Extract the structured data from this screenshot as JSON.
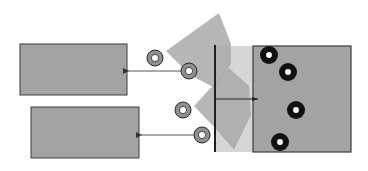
{
  "diagram": {
    "width": 368,
    "height": 171,
    "background": "#ffffff",
    "colors": {
      "box_fill": "#a3a3a3",
      "box_stroke": "#3c3c3c",
      "fan_fill": "#a9a9a9",
      "band_fill": "#d6d6d6",
      "bar": "#1e1e1e",
      "arrow": "#555555",
      "roller_ring": "#8f8f8f",
      "roller_stroke": "#2a2a2a",
      "dot_ring": "#111111",
      "dot_center": "#ffffff"
    },
    "left_boxes": [
      {
        "id": "upper-output-box",
        "x": 20,
        "y": 44,
        "w": 107,
        "h": 51
      },
      {
        "id": "lower-output-box",
        "x": 31,
        "y": 107,
        "w": 108,
        "h": 51
      }
    ],
    "target_box": {
      "id": "target-box",
      "x": 253,
      "y": 46,
      "w": 98,
      "h": 106
    },
    "light_band": {
      "x": 215,
      "y": 46,
      "w": 38,
      "h": 106
    },
    "vertical_bar": {
      "x": 215,
      "y1": 45,
      "y2": 152
    },
    "fans": [
      {
        "id": "upper-fan",
        "points": "166,51 219,13 231,44 231,64 215,88 190,75"
      },
      {
        "id": "lower-fan",
        "points": "194,106 229,68 249,86 251,115 234,150 215,128"
      }
    ],
    "connector": {
      "x1": 215,
      "y1": 99,
      "x2": 258,
      "y2": 99
    },
    "arrows": [
      {
        "id": "upper-arrow",
        "x1": 183,
        "y1": 71,
        "x2": 128,
        "y2": 71
      },
      {
        "id": "lower-arrow",
        "x1": 196,
        "y1": 135,
        "x2": 141,
        "y2": 135
      }
    ],
    "rollers": [
      {
        "id": "roller-1",
        "cx": 155,
        "cy": 58,
        "r": 8
      },
      {
        "id": "roller-2",
        "cx": 189,
        "cy": 71,
        "r": 8
      },
      {
        "id": "roller-3",
        "cx": 183,
        "cy": 110,
        "r": 8
      },
      {
        "id": "roller-4",
        "cx": 202,
        "cy": 135,
        "r": 8
      }
    ],
    "dots": [
      {
        "id": "dot-1",
        "cx": 269,
        "cy": 55,
        "r": 9
      },
      {
        "id": "dot-2",
        "cx": 288,
        "cy": 72,
        "r": 9
      },
      {
        "id": "dot-3",
        "cx": 296,
        "cy": 110,
        "r": 9
      },
      {
        "id": "dot-4",
        "cx": 280,
        "cy": 142,
        "r": 9
      }
    ]
  }
}
